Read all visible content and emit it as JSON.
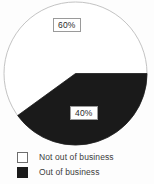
{
  "chart_data": {
    "type": "pie",
    "title": "",
    "categories": [
      "Not out of business",
      "Out of business"
    ],
    "values": [
      60,
      40
    ],
    "labels": [
      "60%",
      "40%"
    ],
    "colors": [
      "#ffffff",
      "#1a1a1a"
    ],
    "start_angle_deg": 0,
    "direction": "clockwise",
    "legend_position": "bottom-left",
    "grid": false,
    "xlabel": "",
    "ylabel": ""
  },
  "pie": {
    "slices": [
      {
        "name": "Not out of business",
        "label": "60%",
        "value": 60,
        "color": "#ffffff",
        "stroke": "#b4b4b4"
      },
      {
        "name": "Out of business",
        "label": "40%",
        "value": 40,
        "color": "#1a1a1a",
        "stroke": "#1a1a1a"
      }
    ]
  },
  "legend": {
    "items": [
      {
        "label": "Not out of business",
        "color": "#ffffff",
        "border": "#6e6e6e"
      },
      {
        "label": "Out of business",
        "color": "#1a1a1a",
        "border": "#1a1a1a"
      }
    ]
  },
  "theme": {
    "background": "#fdfdfd",
    "text": "#3c3c3c",
    "outline": "#b4b4b4",
    "dark_slice": "#1a1a1a",
    "light_slice": "#ffffff"
  }
}
